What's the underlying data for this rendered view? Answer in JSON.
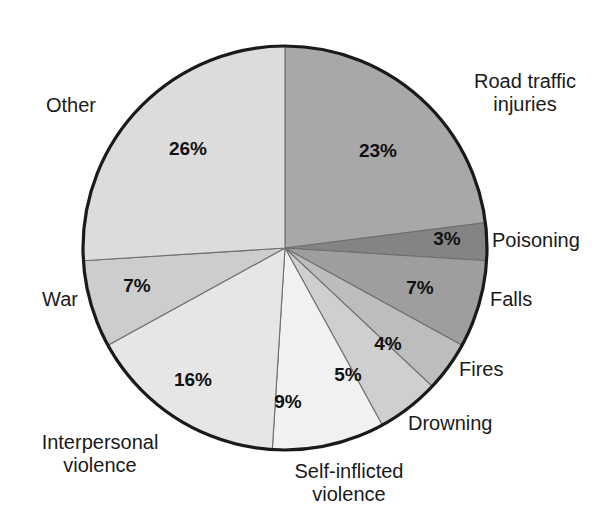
{
  "chart_data": {
    "type": "pie",
    "title": "",
    "subtitle": "",
    "xlabel": "",
    "ylabel": "",
    "units": "percent",
    "total": 100,
    "start_angle_deg": 0,
    "direction": "clockwise",
    "legend_position": "outside-labels",
    "grid": false,
    "categories": [
      "Road traffic injuries",
      "Poisoning",
      "Falls",
      "Fires",
      "Drowning",
      "Self-inflicted violence",
      "Interpersonal violence",
      "War",
      "Other"
    ],
    "values": [
      23,
      3,
      7,
      4,
      5,
      9,
      16,
      7,
      26
    ],
    "value_labels": [
      "23%",
      "3%",
      "7%",
      "4%",
      "5%",
      "9%",
      "16%",
      "7%",
      "26%"
    ],
    "colors": [
      "#a8a8a8",
      "#848484",
      "#9e9e9e",
      "#bdbdbd",
      "#cfcfcf",
      "#f1f1f1",
      "#e6e6e6",
      "#cdcdcd",
      "#dcdcdc"
    ],
    "slices": [
      {
        "label": "Road traffic injuries",
        "value": 23,
        "value_label": "23%",
        "color": "#a8a8a8"
      },
      {
        "label": "Poisoning",
        "value": 3,
        "value_label": "3%",
        "color": "#848484"
      },
      {
        "label": "Falls",
        "value": 7,
        "value_label": "7%",
        "color": "#9e9e9e"
      },
      {
        "label": "Fires",
        "value": 4,
        "value_label": "4%",
        "color": "#bdbdbd"
      },
      {
        "label": "Drowning",
        "value": 5,
        "value_label": "5%",
        "color": "#cfcfcf"
      },
      {
        "label": "Self-inflicted violence",
        "value": 9,
        "value_label": "9%",
        "color": "#f1f1f1"
      },
      {
        "label": "Interpersonal violence",
        "value": 16,
        "value_label": "16%",
        "color": "#e6e6e6"
      },
      {
        "label": "War",
        "value": 7,
        "value_label": "7%",
        "color": "#cdcdcd"
      },
      {
        "label": "Other",
        "value": 26,
        "value_label": "26%",
        "color": "#dcdcdc"
      }
    ]
  },
  "labels": {
    "road_traffic_line1": "Road traffic",
    "road_traffic_line2": "injuries",
    "poisoning": "Poisoning",
    "falls": "Falls",
    "fires": "Fires",
    "drowning": "Drowning",
    "self_inflicted_line1": "Self-inflicted",
    "self_inflicted_line2": "violence",
    "interpersonal_line1": "Interpersonal",
    "interpersonal_line2": "violence",
    "war": "War",
    "other": "Other"
  },
  "percent_labels": {
    "road_traffic": "23%",
    "poisoning": "3%",
    "falls": "7%",
    "fires": "4%",
    "drowning": "5%",
    "self_inflicted": "9%",
    "interpersonal": "16%",
    "war": "7%",
    "other": "26%"
  },
  "style": {
    "outline_color": "#1a1a1a",
    "separator_color": "#6f6f6f",
    "background": "#ffffff"
  }
}
